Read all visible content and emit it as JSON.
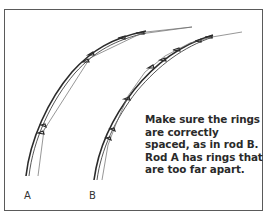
{
  "diagram": {
    "type": "illustration",
    "rods": [
      {
        "id": "A",
        "label": "A",
        "ring_spacing": "too far apart",
        "ring_count": 6
      },
      {
        "id": "B",
        "label": "B",
        "ring_spacing": "correct",
        "ring_count": 8
      }
    ],
    "caption": {
      "lines": [
        "Make sure the rings",
        "are correctly",
        "spaced, as in rod B.",
        "Rod A has rings that",
        "are too far apart."
      ]
    },
    "colors": {
      "rod": "#2b2b2b",
      "line": "#6a6a6a",
      "frame": "#5a5a5a",
      "text": "#2a2a2a"
    }
  }
}
